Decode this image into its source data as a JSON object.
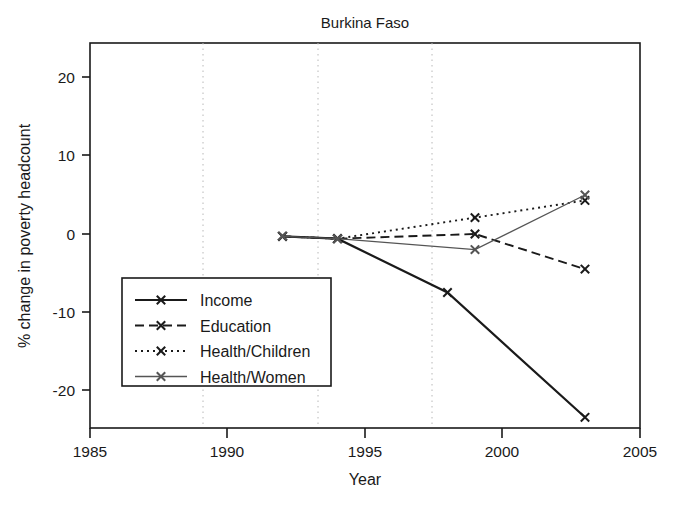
{
  "chart_data": {
    "type": "line",
    "title": "Burkina Faso",
    "xlabel": "Year",
    "ylabel": "% change in poverty headcount",
    "xlim": [
      1985,
      2005
    ],
    "ylim": [
      -24.5,
      24.5
    ],
    "xticks": [
      1985,
      1990,
      1995,
      2000,
      2005
    ],
    "xtick_labels": [
      "1985",
      "1990",
      "1995",
      "2000",
      "2005"
    ],
    "yticks": [
      20,
      10,
      0,
      -10,
      -20
    ],
    "ytick_labels": [
      "20",
      "10",
      "0",
      "-10",
      "-20"
    ],
    "grid": "vertical-dotted-minor",
    "legend_position": "lower-left-inside",
    "marker": "x",
    "series": [
      {
        "name": "Income",
        "style": "solid",
        "color": "#1a1a1a",
        "x": [
          1992,
          1994,
          1998,
          2003
        ],
        "y": [
          -0.3,
          -0.6,
          -7.5,
          -23.5
        ]
      },
      {
        "name": "Education",
        "style": "dashed",
        "color": "#1a1a1a",
        "x": [
          1992,
          1994,
          1999,
          2003
        ],
        "y": [
          -0.3,
          -0.6,
          0.0,
          -4.5
        ]
      },
      {
        "name": "Health/Children",
        "style": "dotted",
        "color": "#1a1a1a",
        "x": [
          1992,
          1994,
          1999,
          2003
        ],
        "y": [
          -0.3,
          -0.6,
          2.1,
          4.3
        ]
      },
      {
        "name": "Health/Women",
        "style": "solid-thin",
        "color": "#555555",
        "x": [
          1992,
          1994,
          1999,
          2003
        ],
        "y": [
          -0.3,
          -0.6,
          -2.0,
          5.0
        ]
      }
    ]
  }
}
